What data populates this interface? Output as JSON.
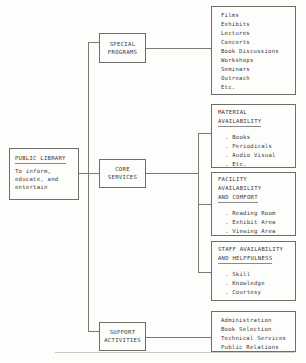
{
  "diagram": {
    "type": "organizational-tree",
    "root": {
      "heading": "PUBLIC LIBRARY",
      "lines": [
        "To inform,",
        "educate, and",
        "entertain"
      ]
    },
    "branches": [
      {
        "id": "special-programs",
        "label_lines": [
          "SPECIAL",
          "PROGRAMS"
        ],
        "children": [
          {
            "id": "programs-list",
            "heading": "",
            "items": [
              "Films",
              "Exhibits",
              "Lectures",
              "Concerts",
              "Book Discussions",
              "Workshops",
              "Seminars",
              "Outreach",
              "Etc."
            ]
          }
        ]
      },
      {
        "id": "core-services",
        "label_lines": [
          "CORE",
          "SERVICES"
        ],
        "children": [
          {
            "id": "material-availability",
            "heading_lines": [
              "MATERIAL",
              "AVAILABILITY"
            ],
            "items": [
              ". Books",
              ". Periodicals",
              ". Audio Visual",
              ". Etc."
            ]
          },
          {
            "id": "facility-availability",
            "heading_lines": [
              "FACILITY",
              "AVAILABILITY",
              "AND COMFORT"
            ],
            "items": [
              ". Reading Room",
              ". Exhibit Area",
              ". Viewing Area"
            ]
          },
          {
            "id": "staff-availability",
            "heading_lines": [
              "STAFF AVAILABILITY",
              "AND HELPFULNESS"
            ],
            "items": [
              ". Skill",
              ". Knowledge",
              ". Courtesy"
            ]
          }
        ]
      },
      {
        "id": "support-activities",
        "label_lines": [
          "SUPPORT",
          "ACTIVITIES"
        ],
        "children": [
          {
            "id": "support-list",
            "heading": "",
            "items": [
              "Administration",
              "Book Selection",
              "Technical Services",
              "Public Relations"
            ]
          }
        ]
      }
    ],
    "colors": {
      "background": "#fdfdfc",
      "box_border": "#6d6d6a",
      "connector": "#7a7a77",
      "text": "#3a3a38",
      "rule": "#c9c9c5"
    }
  }
}
